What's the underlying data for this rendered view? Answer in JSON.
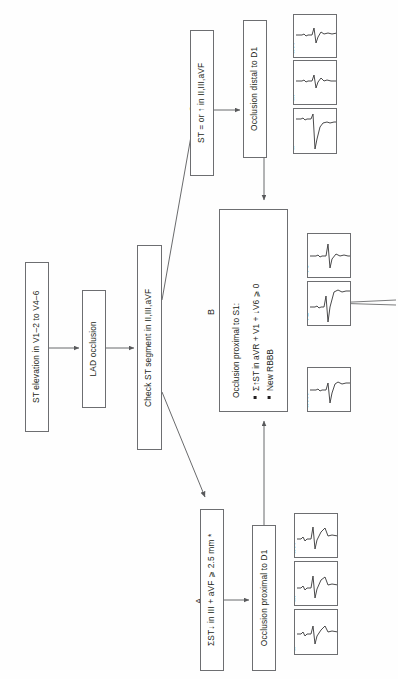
{
  "diagram": {
    "orientation": "rotated-90-ccw",
    "nodes": {
      "start": "ST elevation in V1–2 to V4–6",
      "lad": "LAD occlusion",
      "check": "Check ST segment in II,III,aVF",
      "branch_a_criteria": "ΣST↓ in III + aVF ⩾ 2.5 mm *",
      "branch_a_result": "Occlusion proximal to D1",
      "branch_c_criteria": "ST = or ↑ in II,III,aVF",
      "branch_c_result": "Occlusion distal to D1",
      "branch_b_header": "Occlusion proximal to S1:",
      "branch_b_bullets": [
        "Σ↑ST in aVR + V1 + ↓V6 ⩾ 0",
        "New RBBB"
      ]
    },
    "branch_labels": {
      "a": "A",
      "b": "B",
      "c": "C"
    },
    "ecg_groups": [
      {
        "group": "branch-a-ecg",
        "leads": [
          "II",
          "III",
          "aVF"
        ]
      },
      {
        "group": "branch-b-ecg",
        "leads": [
          "aVR",
          "V1",
          "V6"
        ]
      },
      {
        "group": "branch-c-ecg",
        "leads": [
          "II",
          "III",
          "aVF"
        ]
      }
    ],
    "colors": {
      "stroke": "#6d6e71",
      "text": "#231f20",
      "background": "#ffffff",
      "trace": "#404041"
    }
  }
}
